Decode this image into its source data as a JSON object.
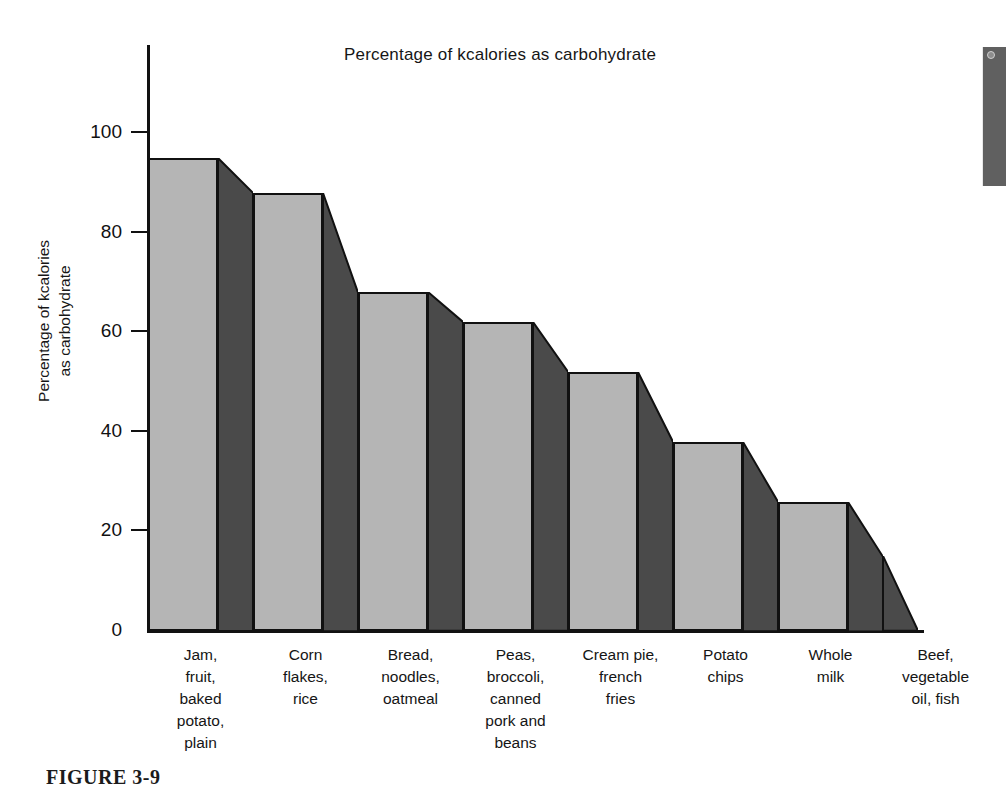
{
  "figure": {
    "caption": "FIGURE 3-9"
  },
  "artifact": {
    "name": "page-edge-shadow",
    "color": "#606060"
  },
  "chart_data": {
    "type": "bar",
    "title": "Percentage of kcalories as carbohydrate",
    "xlabel": "",
    "ylabel": "Percentage of kcalories\nas carbohydrate",
    "ylabel_lines": [
      "Percentage of kcalories",
      "as carbohydrate"
    ],
    "categories": [
      "Jam,\nfruit,\nbaked\npotato,\nplain",
      "Corn\nflakes,\nrice",
      "Bread,\nnoodles,\noatmeal",
      "Peas,\nbroccoli,\ncanned\npork and\nbeans",
      "Cream pie,\nfrench\nfries",
      "Potato\nchips",
      "Whole\nmilk",
      "Beef,\nvegetable\noil, fish"
    ],
    "category_lines": [
      [
        "Jam,",
        "fruit,",
        "baked",
        "potato,",
        "plain"
      ],
      [
        "Corn",
        "flakes,",
        "rice"
      ],
      [
        "Bread,",
        "noodles,",
        "oatmeal"
      ],
      [
        "Peas,",
        "broccoli,",
        "canned",
        "pork and",
        "beans"
      ],
      [
        "Cream pie,",
        "french",
        "fries"
      ],
      [
        "Potato",
        "chips"
      ],
      [
        "Whole",
        "milk"
      ],
      [
        "Beef,",
        "vegetable",
        "oil, fish"
      ]
    ],
    "values": [
      95,
      88,
      68,
      62,
      52,
      38,
      26,
      15
    ],
    "ylim": [
      0,
      120
    ],
    "yticks": [
      0,
      20,
      40,
      60,
      80,
      100
    ],
    "ytick_labels": [
      "0",
      "20",
      "40",
      "60",
      "80",
      "100"
    ],
    "grid": false,
    "legend": null,
    "colors": {
      "bar_face": "#b5b5b5",
      "bar_side": "#4a4a4a",
      "outline": "#111111",
      "axis": "#111111",
      "background": "#ffffff"
    },
    "style_note": "3-D stepped bars; each bar has a light front face and a dark right-side face whose top edge slopes down to the next bar's height. The last category is drawn as a sloped side face only."
  }
}
